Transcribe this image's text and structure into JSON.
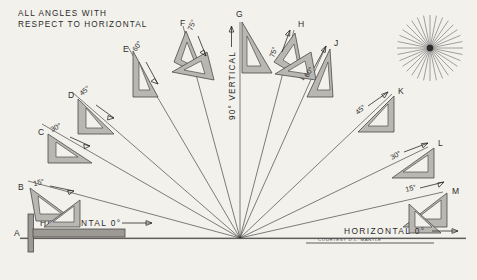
{
  "title": {
    "line1": "ALL ANGLES WITH",
    "line2": "RESPECT TO HORIZONTAL"
  },
  "labels": {
    "horizontal_left": "HORIZONTAL  0°",
    "horizontal_right": "HORIZONTAL  0°",
    "vertical": "90° VERTICAL",
    "credit": "COURTESY D.L. MANTLE"
  },
  "colors": {
    "background": "#f3f1ec",
    "ink": "#2b2b2b",
    "line": "#3a3a3a",
    "triangle_fill": "#b9b7b2",
    "triangle_edge": "#4a4a4a",
    "tsquare_fill": "#9d9a95"
  },
  "chart_data": {
    "type": "diagram",
    "title": "ALL ANGLES WITH RESPECT TO HORIZONTAL",
    "vertex": {
      "x": 240,
      "y": 238
    },
    "stations": [
      {
        "key": "A",
        "label": "A",
        "angle_deg": 0,
        "angle_text": "HORIZONTAL  0°",
        "side": "left",
        "tool": "t-square"
      },
      {
        "key": "B",
        "label": "B",
        "angle_deg": 15,
        "angle_text": "15°",
        "side": "left",
        "tool": "triangle-pair"
      },
      {
        "key": "C",
        "label": "C",
        "angle_deg": 30,
        "angle_text": "30°",
        "side": "left",
        "tool": "triangle"
      },
      {
        "key": "D",
        "label": "D",
        "angle_deg": 45,
        "angle_text": "45°",
        "side": "left",
        "tool": "triangle"
      },
      {
        "key": "E",
        "label": "E",
        "angle_deg": 60,
        "angle_text": "60°",
        "side": "left",
        "tool": "triangle"
      },
      {
        "key": "F",
        "label": "F",
        "angle_deg": 75,
        "angle_text": "75°",
        "side": "left",
        "tool": "triangle-pair"
      },
      {
        "key": "G",
        "label": "G",
        "angle_deg": 90,
        "angle_text": "90° VERTICAL",
        "side": "center",
        "tool": "triangle"
      },
      {
        "key": "H",
        "label": "H",
        "angle_deg": 75,
        "angle_text": "75°",
        "side": "right",
        "tool": "triangle-pair"
      },
      {
        "key": "J",
        "label": "J",
        "angle_deg": 60,
        "angle_text": "60°",
        "side": "right",
        "tool": "triangle"
      },
      {
        "key": "K",
        "label": "K",
        "angle_deg": 45,
        "angle_text": "45°",
        "side": "right",
        "tool": "triangle"
      },
      {
        "key": "L",
        "label": "L",
        "angle_deg": 30,
        "angle_text": "30°",
        "side": "right",
        "tool": "triangle"
      },
      {
        "key": "M",
        "label": "M",
        "angle_deg": 15,
        "angle_text": "15°",
        "side": "right",
        "tool": "triangle-pair"
      },
      {
        "key": "M0",
        "label": "",
        "angle_deg": 0,
        "angle_text": "HORIZONTAL  0°",
        "side": "right",
        "tool": "rule"
      }
    ],
    "starburst": {
      "cx": 430,
      "cy": 48,
      "rays": 32,
      "radius": 33
    }
  }
}
